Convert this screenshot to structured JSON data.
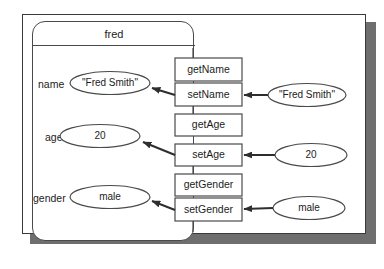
{
  "diagram": {
    "type": "object-interaction-diagram",
    "object": {
      "name": "fred"
    },
    "attributes": [
      {
        "label": "name",
        "value": "\"Fred Smith\""
      },
      {
        "label": "age",
        "value": "20"
      },
      {
        "label": "gender",
        "value": "male"
      }
    ],
    "methods": [
      {
        "label": "getName"
      },
      {
        "label": "setName"
      },
      {
        "label": "getAge"
      },
      {
        "label": "setAge"
      },
      {
        "label": "getGender"
      },
      {
        "label": "setGender"
      }
    ],
    "arguments": [
      {
        "value": "\"Fred Smith\"",
        "target": "setName"
      },
      {
        "value": "20",
        "target": "setAge"
      },
      {
        "value": "male",
        "target": "setGender"
      }
    ],
    "colors": {
      "stroke": "#4a4a4a",
      "frame_stroke": "#3a3a3a",
      "shadow": "#6e6e6e",
      "background": "#ffffff",
      "text": "#1c1c1c"
    }
  }
}
